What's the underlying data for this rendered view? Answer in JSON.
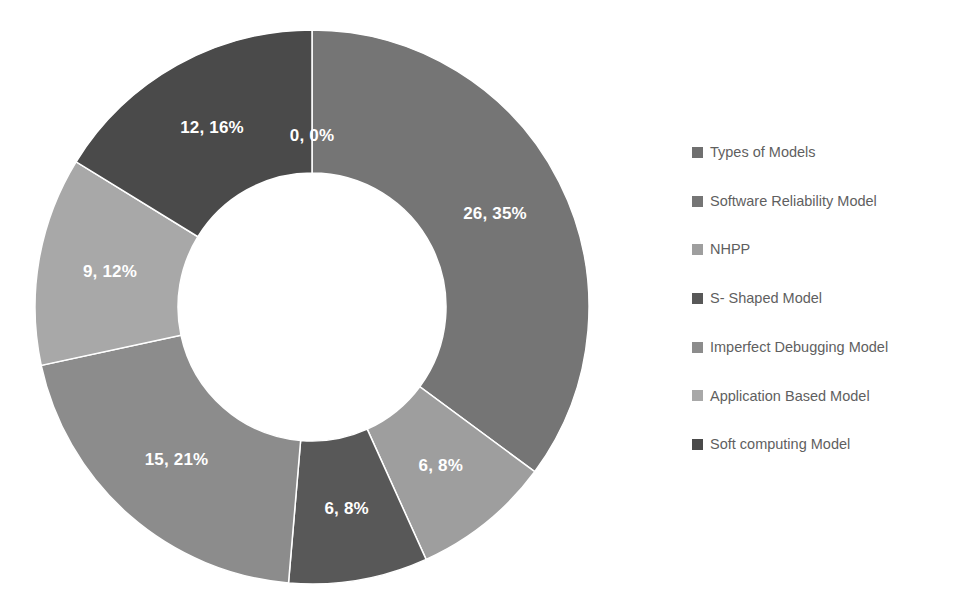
{
  "chart_data": {
    "type": "pie",
    "variant": "doughnut",
    "title": "",
    "subtitle": "",
    "xlabel": "",
    "ylabel": "",
    "grid": false,
    "legend_position": "right",
    "total": 74,
    "hole_ratio": 0.484,
    "start_angle_deg": 0,
    "direction": "clockwise",
    "categories": [
      "Types of Models",
      "Software Reliability Model",
      "NHPP",
      "S- Shaped Model",
      "Imperfect Debugging Model",
      "Application Based Model",
      "Soft computing Model"
    ],
    "values": [
      0,
      26,
      6,
      6,
      15,
      9,
      12
    ],
    "percents": [
      0,
      35,
      8,
      8,
      21,
      12,
      16
    ],
    "data_labels": [
      "0, 0%",
      "26, 35%",
      "6, 8%",
      "6, 8%",
      "15, 21%",
      "9, 12%",
      "12, 16%"
    ],
    "colors": [
      "#6f6f6f",
      "#757575",
      "#9e9e9e",
      "#585858",
      "#8c8c8c",
      "#a8a8a8",
      "#4a4a4a"
    ],
    "label_text_color": "#ffffff",
    "slice_border_color": "#ffffff",
    "background_color": "#ffffff"
  },
  "legend": {
    "items": [
      {
        "label": "Types of Models",
        "color": "#6f6f6f"
      },
      {
        "label": "Software Reliability Model",
        "color": "#757575"
      },
      {
        "label": "NHPP",
        "color": "#9e9e9e"
      },
      {
        "label": "S- Shaped Model",
        "color": "#585858"
      },
      {
        "label": "Imperfect Debugging Model",
        "color": "#8c8c8c"
      },
      {
        "label": "Application Based Model",
        "color": "#a8a8a8"
      },
      {
        "label": "Soft computing Model",
        "color": "#4a4a4a"
      }
    ],
    "text_color": "#5f5f5f"
  },
  "geometry": {
    "center_x": 312,
    "center_y": 307,
    "outer_radius": 277,
    "inner_radius": 134,
    "label_radius": 205
  }
}
